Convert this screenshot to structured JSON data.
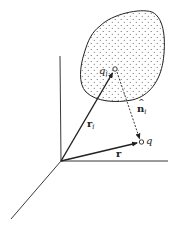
{
  "figure": {
    "type": "vector diagram"
  },
  "labels": {
    "source_point": "q",
    "source_point_sub": "i",
    "field_point": "q",
    "position_vector_source": "r",
    "position_vector_source_sub": "i",
    "position_vector_field": "r",
    "unit_vector": "n",
    "unit_vector_sub": "i",
    "unit_vector_hat": "^"
  },
  "colors": {
    "line": "#222222",
    "blob_fill": "#ffffff",
    "dots": "#555555"
  }
}
